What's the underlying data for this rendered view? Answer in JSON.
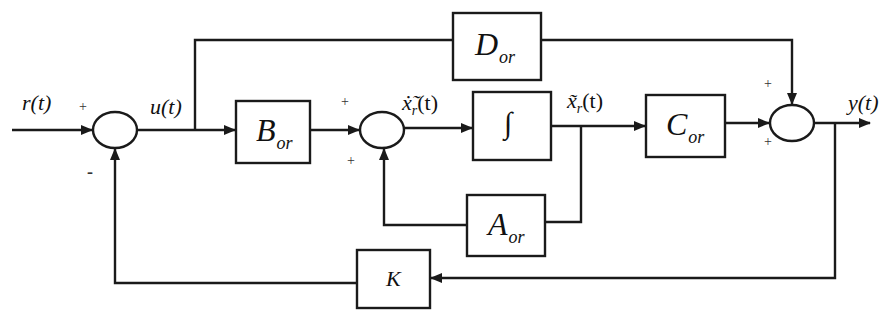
{
  "diagram": {
    "type": "block-diagram",
    "blocks": {
      "B": {
        "main": "B",
        "sub": "or"
      },
      "integrator": {
        "symbol": "∫"
      },
      "C": {
        "main": "C",
        "sub": "or"
      },
      "A": {
        "main": "A",
        "sub": "or"
      },
      "D": {
        "main": "D",
        "sub": "or"
      },
      "K": {
        "main": "K"
      }
    },
    "signals": {
      "reference": "r(t)",
      "control": "u(t)",
      "state_derivative": "ẋ̃r(t)",
      "state_derivative_base": "ẋ̃",
      "state_derivative_sub": "r",
      "state_derivative_arg": "(t)",
      "state": "x̃r(t)",
      "state_base": "x̃",
      "state_sub": "r",
      "state_arg": "(t)",
      "output": "y(t)"
    },
    "summing_junctions": {
      "sum1": {
        "top_left_sign": "+",
        "bottom_sign": "-"
      },
      "sum2": {
        "top_left_sign": "+",
        "bottom_sign": "+"
      },
      "sum3": {
        "top_sign": "+",
        "bottom_sign": "+"
      }
    },
    "colors": {
      "line": "#1a1a1a",
      "background": "#ffffff"
    }
  }
}
